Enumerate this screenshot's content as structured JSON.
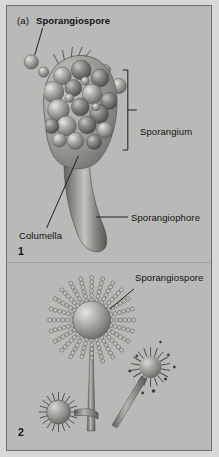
{
  "figure": {
    "background_color": "#b9b9b7",
    "frame_color": "#6e6e6e",
    "ink_color": "#111111"
  },
  "panel_1": {
    "number": "1",
    "part_letter": "(a)",
    "labels": {
      "sporangiospore": "Sporangiospore",
      "sporangium": "Sporangium",
      "sporangiophore": "Sporangiophore",
      "columella": "Columella"
    },
    "structures": {
      "sporangium_sac": "sporangium-sac",
      "free_spore": "free-sporangiospore",
      "stalk": "sporangiophore-stalk",
      "columella_dome": "columella-dome"
    }
  },
  "panel_2": {
    "number": "2",
    "labels": {
      "sporangiospore": "Sporangiospore"
    },
    "structures": {
      "main_head": "radiating-spore-head-large",
      "secondary_head": "radiating-spore-head-medium",
      "small_head": "radiating-spore-head-small"
    }
  }
}
